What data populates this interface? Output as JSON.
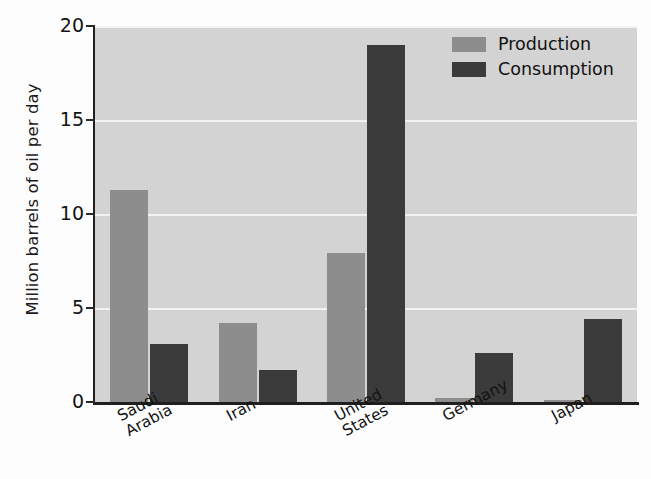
{
  "chart_data": {
    "type": "bar",
    "title": "",
    "xlabel": "",
    "ylabel": "Million barrels of oil per day",
    "categories": [
      "Saudi\nArabia",
      "Iran",
      "United\nStates",
      "Germany",
      "Japan"
    ],
    "ylim": [
      0,
      20
    ],
    "yticks": [
      0,
      5,
      10,
      15,
      20
    ],
    "ytick_labels": [
      "0",
      "5",
      "10",
      "15",
      "20"
    ],
    "grid": true,
    "grid_orientation": "horizontal",
    "legend_position": "top-right",
    "series": [
      {
        "name": "Production",
        "color": "#8d8d8d",
        "values": [
          11.3,
          4.2,
          7.9,
          0.2,
          0.1
        ]
      },
      {
        "name": "Consumption",
        "color": "#3b3b3b",
        "values": [
          3.1,
          1.7,
          19.0,
          2.6,
          4.4
        ]
      }
    ],
    "plot_background": "#d3d3d3",
    "gridline_color": "#f2f2f2",
    "axis_color": "#1f1f1f"
  }
}
